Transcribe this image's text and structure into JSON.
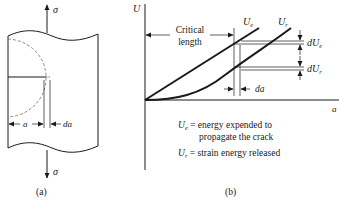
{
  "panel_a": {
    "caption": "(a)",
    "stress_top_label": "σ",
    "stress_bottom_label": "σ",
    "crack_length_label": "a",
    "crack_increment_label": "da"
  },
  "panel_b": {
    "caption": "(b)",
    "y_axis_label": "U",
    "x_axis_label": "a",
    "critical_length_line1": "Critical",
    "critical_length_line2": "length",
    "curve_ue_label": "U",
    "curve_ue_sub": "e",
    "curve_ur_label": "U",
    "curve_ur_sub": "r",
    "due_label": "dU",
    "due_sub": "e",
    "dur_label": "dU",
    "dur_sub": "r",
    "da_label": "da",
    "legend": [
      {
        "symbol": "U",
        "sub": "e",
        "text": " = energy expended to",
        "text2": "propagate the crack"
      },
      {
        "symbol": "U",
        "sub": "r",
        "text": " = strain energy released"
      }
    ]
  },
  "colors": {
    "ink": "#1a1a1a",
    "dashed": "#6a6a6a"
  }
}
